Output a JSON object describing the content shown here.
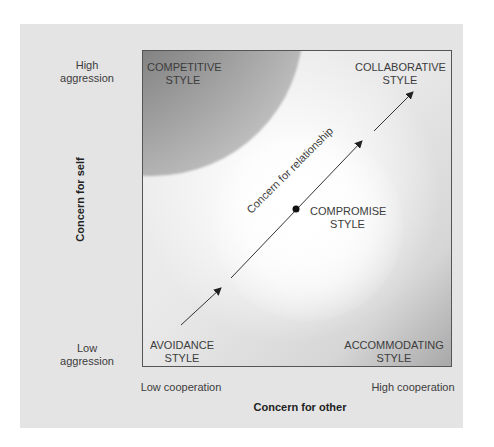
{
  "diagram": {
    "title_axes": {
      "y_axis": "Concern for self",
      "x_axis": "Concern for other"
    },
    "y_ticks": {
      "high": [
        "High",
        "aggression"
      ],
      "low": [
        "Low",
        "aggression"
      ]
    },
    "x_ticks": {
      "low": "Low cooperation",
      "high": "High cooperation"
    },
    "styles": {
      "competitive": [
        "COMPETITIVE",
        "STYLE"
      ],
      "collaborative": [
        "COLLABORATIVE",
        "STYLE"
      ],
      "compromise": [
        "COMPROMISE",
        "STYLE"
      ],
      "avoidance": [
        "AVOIDANCE",
        "STYLE"
      ],
      "accommodating": [
        "ACCOMMODATING",
        "STYLE"
      ]
    },
    "diagonal_label": "Concern for relationship",
    "colors": {
      "panel": "#e4e4e4",
      "box_border": "#555555",
      "dark_corner": "#5a5a5a",
      "arrow": "#222222"
    }
  }
}
